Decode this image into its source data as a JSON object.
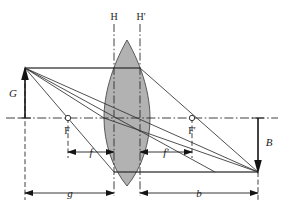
{
  "diagram": {
    "type": "optics-ray-diagram",
    "background_color": "#ffffff",
    "lens_fill_color": "#b2b2b2",
    "line_color": "#2b2b2b",
    "labels": {
      "principal_plane_front": "H",
      "principal_plane_back": "H'",
      "object_height": "G",
      "image_height": "B",
      "focal_point_front": "F",
      "focal_point_back": "F'",
      "focal_length_front": "f",
      "focal_length_back": "f'",
      "object_distance": "g",
      "image_distance": "b"
    },
    "geometry": {
      "optical_axis_y": 118,
      "object_x": 25,
      "object_tip_y": 68,
      "image_x": 258,
      "image_tip_y": 172,
      "plane_H_x": 114,
      "plane_H_prime_x": 140,
      "focal_F_x": 68,
      "focal_F_prime_x": 192,
      "lens_center_x": 127,
      "lens_top_y": 40,
      "lens_bottom_y": 186
    },
    "dimensions": {
      "f_from_x": 68,
      "f_to_x": 114,
      "f_label_x": 91,
      "f_prime_from_x": 140,
      "f_prime_to_x": 192,
      "f_prime_label_x": 166,
      "g_from_x": 25,
      "g_to_x": 114,
      "g_label_x": 70,
      "b_from_x": 140,
      "b_to_x": 258,
      "b_label_x": 199
    }
  }
}
